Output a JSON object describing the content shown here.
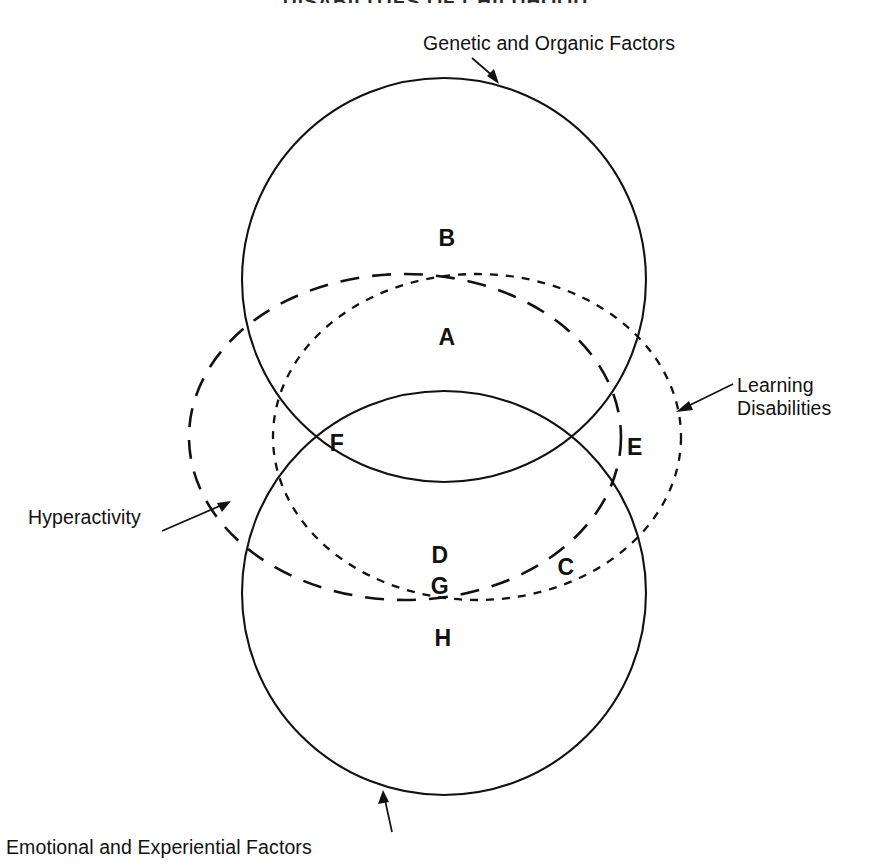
{
  "figure": {
    "title": "DISABILITIES OF CHILDHOOD",
    "background_color": "#ffffff",
    "stroke_color": "#111111",
    "type": "venn-diagram",
    "callouts": [
      {
        "id": "genetic",
        "text": "Genetic and Organic Factors",
        "line_style": "solid",
        "target": "upper-solid-circle"
      },
      {
        "id": "learning",
        "line1": "Learning",
        "line2": "Disabilities",
        "line_style": "short-dash",
        "target": "learning-disabilities-circle"
      },
      {
        "id": "hyperactivity",
        "text": "Hyperactivity",
        "line_style": "long-dash",
        "target": "hyperactivity-ellipse"
      },
      {
        "id": "emotional",
        "text": "Emotional and Experiential Factors",
        "line_style": "solid",
        "target": "lower-solid-circle"
      }
    ],
    "region_labels": [
      {
        "letter": "B",
        "x": 447,
        "y": 238
      },
      {
        "letter": "A",
        "x": 447,
        "y": 337
      },
      {
        "letter": "F",
        "x": 337,
        "y": 443
      },
      {
        "letter": "E",
        "x": 635,
        "y": 447
      },
      {
        "letter": "D",
        "x": 440,
        "y": 555
      },
      {
        "letter": "C",
        "x": 566,
        "y": 567
      },
      {
        "letter": "G",
        "x": 440,
        "y": 586
      },
      {
        "letter": "H",
        "x": 443,
        "y": 638
      }
    ],
    "shapes": [
      {
        "id": "upper-solid-circle",
        "kind": "circle",
        "cx": 444,
        "cy": 280,
        "r": 202,
        "style": "solid"
      },
      {
        "id": "lower-solid-circle",
        "kind": "circle",
        "cx": 444,
        "cy": 593,
        "r": 202,
        "style": "solid"
      },
      {
        "id": "hyperactivity-ellipse",
        "kind": "ellipse",
        "cx": 405,
        "cy": 437,
        "rx": 216,
        "ry": 163,
        "style": "long-dash"
      },
      {
        "id": "learning-disabilities-circle",
        "kind": "ellipse",
        "cx": 477,
        "cy": 437,
        "rx": 204,
        "ry": 163,
        "style": "short-dash"
      }
    ]
  }
}
